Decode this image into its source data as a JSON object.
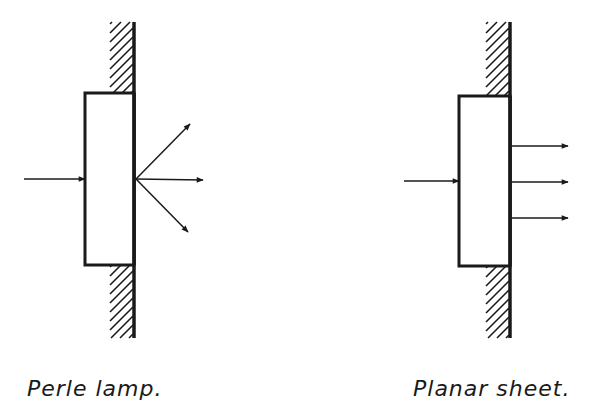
{
  "diagrams": [
    {
      "id": "perle-lamp",
      "label": "Perle lamp.",
      "wall": {
        "x": 134,
        "y1": 22,
        "y2": 338
      },
      "block": {
        "x": 85,
        "y": 93,
        "w": 49,
        "h": 172
      },
      "hatch_top": {
        "y1": 22,
        "y2": 93
      },
      "hatch_bottom": {
        "y1": 265,
        "y2": 338
      },
      "incoming_arrow": {
        "x1": 24,
        "y1": 179,
        "x2": 85,
        "y2": 179
      },
      "outgoing_arrows": [
        {
          "x1": 136,
          "y1": 179,
          "x2": 190,
          "y2": 124
        },
        {
          "x1": 136,
          "y1": 179,
          "x2": 203,
          "y2": 180
        },
        {
          "x1": 136,
          "y1": 179,
          "x2": 188,
          "y2": 232
        }
      ],
      "emission": "divergent"
    },
    {
      "id": "planar-sheet",
      "label": "Planar sheet.",
      "wall": {
        "x": 510,
        "y1": 22,
        "y2": 338
      },
      "block": {
        "x": 459,
        "y": 96,
        "w": 51,
        "h": 170
      },
      "hatch_top": {
        "y1": 22,
        "y2": 96
      },
      "hatch_bottom": {
        "y1": 266,
        "y2": 338
      },
      "incoming_arrow": {
        "x1": 404,
        "y1": 181,
        "x2": 459,
        "y2": 181
      },
      "outgoing_arrows": [
        {
          "x1": 512,
          "y1": 146,
          "x2": 568,
          "y2": 146
        },
        {
          "x1": 512,
          "y1": 182,
          "x2": 568,
          "y2": 182
        },
        {
          "x1": 512,
          "y1": 218,
          "x2": 568,
          "y2": 218
        }
      ],
      "emission": "parallel"
    }
  ],
  "colors": {
    "ink": "#1a1a1a",
    "background": "#ffffff"
  }
}
